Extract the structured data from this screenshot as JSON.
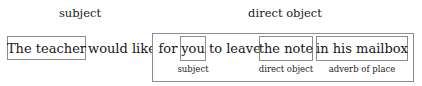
{
  "figure": {
    "type": "sentence-diagram",
    "background_color": "#ffffff",
    "border_color": "#8d8d8d",
    "text_color": "#161616",
    "full_sentence": "The teacher would like for you to leave the note in his mailbox"
  },
  "main_clause": {
    "subject_header": "subject",
    "subject_text": "The teacher",
    "verb_text": "would like"
  },
  "direct_object_clause": {
    "header": "direct object",
    "complementizer": "for",
    "embedded_subject": "you",
    "embedded_subject_label": "subject",
    "infinitive_verb": "to leave",
    "embedded_object": "the note",
    "embedded_object_label": "direct object",
    "adverbial": "in his mailbox",
    "adverbial_label": "adverb of place"
  }
}
